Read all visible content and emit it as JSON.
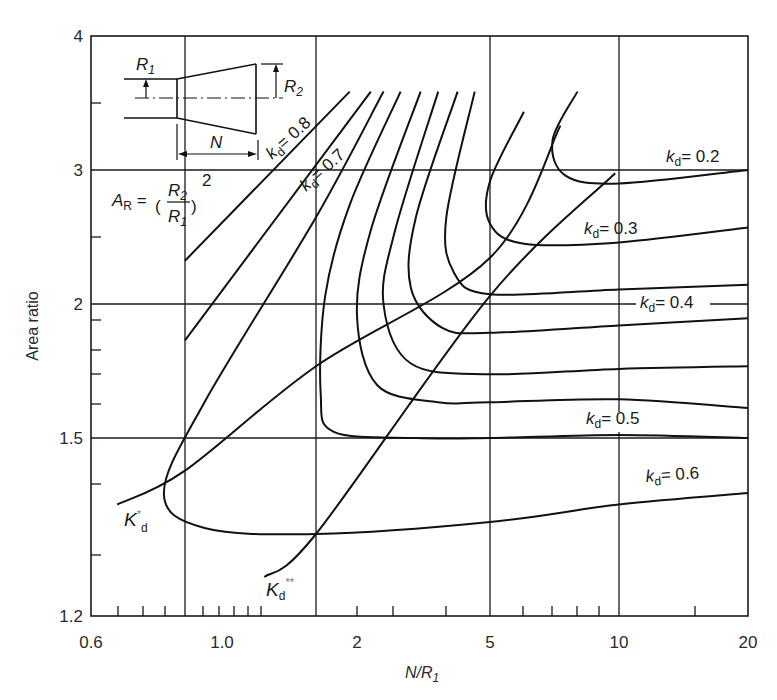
{
  "chart_data": {
    "type": "line",
    "title": "",
    "xlabel": "N/R1",
    "ylabel": "Area ratio",
    "xscale": "log",
    "yscale": "log",
    "xlim": [
      0.6,
      20
    ],
    "ylim": [
      1.2,
      4
    ],
    "grid": true,
    "x_tick_labels": [
      "0.6",
      "1.0",
      "2",
      "5",
      "10",
      "20"
    ],
    "y_tick_labels": [
      "1.2",
      "1.5",
      "2",
      "3",
      "4"
    ],
    "annotations": {
      "formula": "A_R = (R2/R1)^2",
      "inset": "diffuser sketch with inlet radius R1, outlet radius R2, length N",
      "optimum_lines": [
        "K*d",
        "Kd**"
      ]
    },
    "series": [
      {
        "name": "kd=0.8",
        "label": "kd = 0.8",
        "points": [
          [
            0.8,
            2.28
          ],
          [
            1.9,
            3.55
          ]
        ]
      },
      {
        "name": "kd=0.7",
        "label": "kd = 0.7",
        "points": [
          [
            0.8,
            1.85
          ],
          [
            2.2,
            3.55
          ]
        ]
      },
      {
        "name": "kd=0.6",
        "label": "kd = 0.6",
        "points": [
          [
            2.4,
            3.55
          ],
          [
            1.5,
            2.6
          ],
          [
            0.9,
            1.62
          ],
          [
            0.75,
            1.4
          ],
          [
            0.9,
            1.34
          ],
          [
            1.5,
            1.33
          ],
          [
            5,
            1.35
          ],
          [
            10,
            1.38
          ],
          [
            20,
            1.4
          ]
        ]
      },
      {
        "name": "kd=0.5 (lower)",
        "label": "",
        "points": [
          [
            2.7,
            3.55
          ],
          [
            1.9,
            2.7
          ],
          [
            1.6,
            2.05
          ],
          [
            1.55,
            1.65
          ],
          [
            1.7,
            1.52
          ],
          [
            3,
            1.5
          ],
          [
            5,
            1.5
          ],
          [
            10,
            1.51
          ],
          [
            20,
            1.5
          ]
        ]
      },
      {
        "name": "kd=0.5",
        "label": "kd = 0.5",
        "points": [
          [
            3.1,
            3.55
          ],
          [
            2.2,
            2.5
          ],
          [
            2.0,
            1.95
          ],
          [
            2.3,
            1.68
          ],
          [
            3.5,
            1.62
          ],
          [
            5,
            1.62
          ],
          [
            10,
            1.63
          ],
          [
            20,
            1.6
          ]
        ]
      },
      {
        "name": "kd=0.45",
        "label": "",
        "points": [
          [
            3.5,
            3.55
          ],
          [
            2.6,
            2.5
          ],
          [
            2.4,
            2.0
          ],
          [
            2.9,
            1.76
          ],
          [
            5,
            1.72
          ],
          [
            10,
            1.74
          ],
          [
            20,
            1.75
          ]
        ]
      },
      {
        "name": "kd=0.4",
        "label": "kd = 0.4",
        "points": [
          [
            4.0,
            3.55
          ],
          [
            3.0,
            2.6
          ],
          [
            2.9,
            2.1
          ],
          [
            3.6,
            1.9
          ],
          [
            5,
            1.88
          ],
          [
            10,
            1.91
          ],
          [
            20,
            1.94
          ]
        ]
      },
      {
        "name": "kd=0.35",
        "label": "",
        "points": [
          [
            4.5,
            3.55
          ],
          [
            3.7,
            2.6
          ],
          [
            3.9,
            2.2
          ],
          [
            5,
            2.06
          ],
          [
            10,
            2.09
          ],
          [
            20,
            2.12
          ]
        ]
      },
      {
        "name": "kd=0.3",
        "label": "kd = 0.3",
        "points": [
          [
            6.0,
            3.4
          ],
          [
            5.0,
            2.9
          ],
          [
            5.0,
            2.55
          ],
          [
            6.0,
            2.4
          ],
          [
            10,
            2.41
          ],
          [
            20,
            2.52
          ]
        ]
      },
      {
        "name": "kd=0.2",
        "label": "kd = 0.2",
        "points": [
          [
            8.0,
            3.55
          ],
          [
            7.0,
            3.2
          ],
          [
            7.5,
            2.95
          ],
          [
            10,
            2.88
          ],
          [
            20,
            3.0
          ]
        ]
      },
      {
        "name": "K*d",
        "label": "K*d",
        "points": [
          [
            0.65,
            1.38
          ],
          [
            0.8,
            1.44
          ],
          [
            1.5,
            1.75
          ],
          [
            5,
            2.3
          ],
          [
            7.3,
            3.3
          ]
        ]
      },
      {
        "name": "Kd**",
        "label": "Kd**",
        "points": [
          [
            1.2,
            1.26
          ],
          [
            1.5,
            1.33
          ],
          [
            5,
            2.05
          ],
          [
            9.8,
            2.97
          ]
        ]
      }
    ]
  },
  "render": {
    "x_map": [
      [
        0.6,
        91
      ],
      [
        0.8,
        185
      ],
      [
        1.0,
        222
      ],
      [
        1.5,
        316
      ],
      [
        2,
        357
      ],
      [
        5,
        490
      ],
      [
        10,
        619
      ],
      [
        20,
        748
      ]
    ],
    "y_map": [
      [
        1.2,
        616
      ],
      [
        1.5,
        438
      ],
      [
        2,
        304
      ],
      [
        3,
        170
      ],
      [
        4,
        36
      ]
    ],
    "x_gridlines": [
      0.8,
      1.5,
      5,
      10
    ],
    "y_gridlines": [
      1.5,
      2,
      3
    ],
    "x_minor_ticks_px": [
      118,
      143,
      165,
      203,
      219,
      234,
      248,
      261,
      357,
      393,
      446,
      523,
      552,
      577,
      599,
      695
    ],
    "y_minor_ticks_px": [
      103,
      237,
      320,
      350,
      374,
      404,
      484,
      555
    ],
    "x_tick_label_px": [
      [
        0.6,
        91
      ],
      [
        1.0,
        222
      ],
      [
        2,
        357
      ],
      [
        5,
        490
      ],
      [
        10,
        619
      ],
      [
        20,
        748
      ]
    ],
    "y_tick_label_px": [
      [
        1.2,
        616
      ],
      [
        1.5,
        438
      ],
      [
        2,
        304
      ],
      [
        3,
        170
      ],
      [
        4,
        36
      ]
    ]
  },
  "labels": {
    "ylabel": "Area ratio",
    "xlabel_main": "N/R",
    "xlabel_sub": "1",
    "r1": "R",
    "r1_sub": "1",
    "r2": "R",
    "r2_sub": "2",
    "n": "N",
    "ar": "A",
    "ar_sub": "R",
    "kd": "k",
    "kd_sub": "d",
    "kd08": "= 0.8",
    "kd07": "= 0.7",
    "kd02": "= 0.2",
    "kd03": "= 0.3",
    "kd04": "= 0.4",
    "kd05": "= 0.5",
    "kd06": "= 0.6",
    "kstar": "K",
    "kstar_sup": "*",
    "kstar_sub": "d",
    "kss": "K",
    "kss_sub": "d",
    "kss_sup": "**"
  }
}
